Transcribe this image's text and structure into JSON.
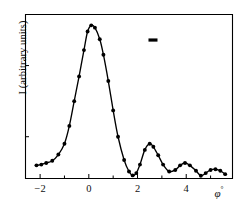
{
  "chart_data": {
    "type": "line",
    "title": "",
    "subtitle": "",
    "xlabel": "φ°",
    "ylabel": "I (arbitrary units)",
    "xlim": [
      -2.6,
      5.9
    ],
    "ylim": [
      0,
      1.06
    ],
    "grid": false,
    "legend": null,
    "xticks": [
      -2,
      0,
      2,
      4
    ],
    "xtick_labels": [
      "−2",
      "0",
      "2",
      "4"
    ],
    "xminor_ticks": [
      -1,
      1,
      3,
      5
    ],
    "yticks": [
      0.27,
      0.73
    ],
    "ytick_labels": [
      "",
      ""
    ],
    "marker": "filled-circle",
    "line_color": "#000000",
    "marker_color": "#000000",
    "axis_color": "#000000",
    "background": "#ffffff",
    "series": [
      {
        "name": "intensity",
        "x": [
          -2.15,
          -1.95,
          -1.75,
          -1.5,
          -1.25,
          -1.0,
          -0.8,
          -0.6,
          -0.4,
          -0.2,
          -0.05,
          0.1,
          0.25,
          0.45,
          0.6,
          0.8,
          1.0,
          1.2,
          1.45,
          1.65,
          1.8,
          1.95,
          2.1,
          2.3,
          2.5,
          2.65,
          2.85,
          3.05,
          3.3,
          3.55,
          3.75,
          3.95,
          4.15,
          4.4,
          4.6,
          4.8,
          5.0,
          5.2,
          5.4,
          5.6
        ],
        "y": [
          0.085,
          0.09,
          0.1,
          0.115,
          0.155,
          0.225,
          0.34,
          0.5,
          0.66,
          0.83,
          0.95,
          0.99,
          0.975,
          0.9,
          0.8,
          0.63,
          0.44,
          0.27,
          0.12,
          0.045,
          0.02,
          0.035,
          0.09,
          0.185,
          0.225,
          0.205,
          0.15,
          0.09,
          0.045,
          0.055,
          0.085,
          0.1,
          0.085,
          0.05,
          0.018,
          0.035,
          0.055,
          0.06,
          0.05,
          0.028
        ]
      }
    ],
    "annotations": [
      {
        "name": "resolution-bar",
        "type": "horizontal-bar",
        "x_start": 2.45,
        "x_end": 2.82,
        "y": 0.895,
        "color": "#000000"
      }
    ]
  }
}
